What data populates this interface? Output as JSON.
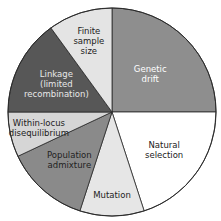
{
  "chart_data": {
    "type": "pie",
    "title": "",
    "start": "top",
    "direction": "clockwise",
    "slices": [
      {
        "label": "Genetic drift",
        "lines": [
          "Genetic",
          "drift"
        ],
        "value": 25,
        "color": "#8e8e8e",
        "text_color": "#ffffff"
      },
      {
        "label": "Natural selection",
        "lines": [
          "Natural",
          "selection"
        ],
        "value": 20,
        "color": "#ffffff",
        "text_color": "#222222"
      },
      {
        "label": "Mutation",
        "lines": [
          "Mutation"
        ],
        "value": 10,
        "color": "#e6e6e6",
        "text_color": "#222222"
      },
      {
        "label": "Population admixture",
        "lines": [
          "Population",
          "admixture"
        ],
        "value": 13,
        "color": "#8a8a8a",
        "text_color": "#222222"
      },
      {
        "label": "Within-locus disequilibrium",
        "lines": [
          "Within-locus",
          "disequilibrium"
        ],
        "value": 7,
        "color": "#d6d6d6",
        "text_color": "#222222"
      },
      {
        "label": "Linkage (limited recombination)",
        "lines": [
          "Linkage",
          "(limited",
          "recombination)"
        ],
        "value": 15,
        "color": "#575757",
        "text_color": "#e8e8e8"
      },
      {
        "label": "Finite sample size",
        "lines": [
          "Finite",
          "sample",
          "size"
        ],
        "value": 10,
        "color": "#e4e4e4",
        "text_color": "#222222"
      }
    ]
  }
}
